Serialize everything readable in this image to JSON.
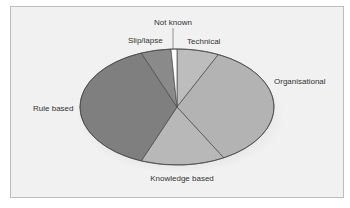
{
  "chart_data": {
    "type": "pie",
    "title": "",
    "slices": [
      {
        "label": "Technical",
        "value": 7,
        "color": "#bdbdbd"
      },
      {
        "label": "Organisational",
        "value": 35,
        "color": "#b3b3b3"
      },
      {
        "label": "Knowledge based",
        "value": 14,
        "color": "#b8b8b8"
      },
      {
        "label": "Rule based",
        "value": 38,
        "color": "#7f7f7f"
      },
      {
        "label": "Slip/lapse",
        "value": 5,
        "color": "#8a8a8a"
      },
      {
        "label": "Not known",
        "value": 1,
        "color": "#ffffff"
      }
    ],
    "start": "top",
    "direction": "clockwise",
    "legend": "none",
    "labels": "outside"
  }
}
